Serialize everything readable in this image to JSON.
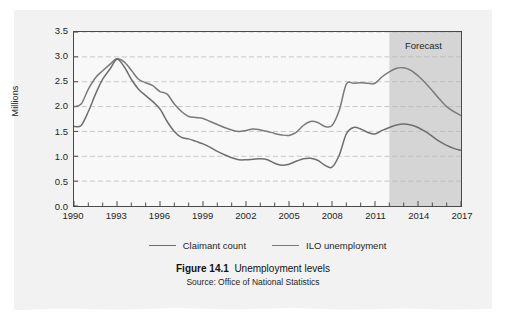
{
  "figure": {
    "number_label": "Figure 14.1",
    "title": "Unemployment levels",
    "source": "Source: Office of National Statistics"
  },
  "annotations": {
    "forecast_label": "Forecast"
  },
  "colors": {
    "page_background": "#f2f2f2",
    "plot_background": "#f8f8f8",
    "axis": "#4a4a4a",
    "gridline": "#b9b9b9",
    "line_claimant": "#6e6e6e",
    "line_ilo": "#7a7a7a",
    "forecast_shade": "#d5d5d5",
    "text": "#1f1f1f"
  },
  "chart_data": {
    "type": "line",
    "title": "Unemployment levels",
    "xlabel": "",
    "ylabel": "Millions",
    "xlim": [
      1990,
      2017
    ],
    "ylim": [
      0.0,
      3.5
    ],
    "grid": true,
    "legend_position": "bottom",
    "y_ticks": [
      "0.0",
      "0.5",
      "1.0",
      "1.5",
      "2.0",
      "2.5",
      "3.0",
      "3.5"
    ],
    "y_tick_values": [
      0.0,
      0.5,
      1.0,
      1.5,
      2.0,
      2.5,
      3.0,
      3.5
    ],
    "x_ticks": [
      "1990",
      "1993",
      "1996",
      "1999",
      "2002",
      "2005",
      "2008",
      "2011",
      "2014",
      "2017"
    ],
    "x_tick_values": [
      1990,
      1993,
      1996,
      1999,
      2002,
      2005,
      2008,
      2011,
      2014,
      2017
    ],
    "x_minor_tick_step": 1,
    "forecast_region": {
      "label": "Forecast",
      "start": 2012.0,
      "end": 2017.0
    },
    "x": [
      1990,
      1990.5,
      1991,
      1991.5,
      1992,
      1992.5,
      1993,
      1993.5,
      1994,
      1994.5,
      1995,
      1995.5,
      1996,
      1996.5,
      1997,
      1997.5,
      1998,
      1998.5,
      1999,
      1999.5,
      2000,
      2000.5,
      2001,
      2001.5,
      2002,
      2002.5,
      2003,
      2003.5,
      2004,
      2004.5,
      2005,
      2005.5,
      2006,
      2006.5,
      2007,
      2007.5,
      2008,
      2008.5,
      2009,
      2009.5,
      2010,
      2010.5,
      2011,
      2011.5,
      2012,
      2012.5,
      2013,
      2013.5,
      2014,
      2014.5,
      2015,
      2015.5,
      2016,
      2016.5,
      2017
    ],
    "series": [
      {
        "name": "ILO unemployment",
        "values": [
          2.0,
          2.05,
          2.35,
          2.58,
          2.72,
          2.85,
          2.96,
          2.9,
          2.73,
          2.55,
          2.48,
          2.42,
          2.3,
          2.25,
          2.05,
          1.9,
          1.8,
          1.78,
          1.76,
          1.7,
          1.64,
          1.58,
          1.53,
          1.5,
          1.52,
          1.55,
          1.53,
          1.5,
          1.46,
          1.43,
          1.42,
          1.48,
          1.62,
          1.7,
          1.68,
          1.6,
          1.62,
          1.92,
          2.45,
          2.47,
          2.48,
          2.47,
          2.47,
          2.6,
          2.7,
          2.77,
          2.78,
          2.73,
          2.62,
          2.48,
          2.32,
          2.15,
          2.0,
          1.9,
          1.82
        ]
      },
      {
        "name": "Claimant count",
        "values": [
          1.6,
          1.62,
          1.9,
          2.25,
          2.55,
          2.75,
          2.95,
          2.8,
          2.55,
          2.35,
          2.22,
          2.1,
          1.95,
          1.7,
          1.5,
          1.38,
          1.35,
          1.3,
          1.25,
          1.18,
          1.1,
          1.03,
          0.97,
          0.93,
          0.93,
          0.94,
          0.95,
          0.93,
          0.86,
          0.82,
          0.84,
          0.9,
          0.95,
          0.96,
          0.92,
          0.82,
          0.78,
          1.02,
          1.45,
          1.58,
          1.55,
          1.48,
          1.45,
          1.52,
          1.58,
          1.63,
          1.65,
          1.63,
          1.58,
          1.5,
          1.4,
          1.3,
          1.22,
          1.16,
          1.12
        ]
      }
    ]
  },
  "legend": [
    {
      "label": "Claimant count"
    },
    {
      "label": "ILO unemployment"
    }
  ]
}
